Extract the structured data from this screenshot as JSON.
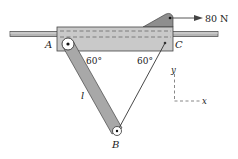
{
  "diagram": {
    "labels": {
      "point_a": "A",
      "point_b": "B",
      "point_c": "C",
      "length": "l",
      "angle_left": "60°",
      "angle_right": "60°",
      "force": "80 N",
      "axis_x": "x",
      "axis_y": "y"
    },
    "colors": {
      "block": "#c9c9c9",
      "bar": "#a8a8a8",
      "rod": "#9a9a9a",
      "bracket": "#8e8e8e",
      "line": "#333333"
    }
  }
}
